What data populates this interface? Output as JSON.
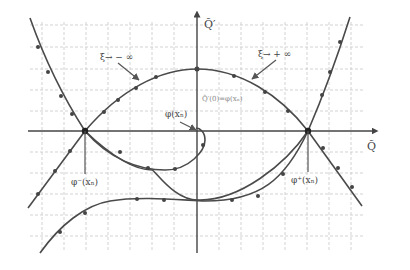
{
  "diagram": {
    "axes": {
      "x_label": "Q̃",
      "y_label": "Q̃′"
    },
    "labels": {
      "xi_minus_inf": "ξ→ − ∞",
      "xi_plus_inf": "ξ→ + ∞",
      "phi_xn": "φ(xₙ)",
      "phi_minus_xn": "φ⁻(xₙ)",
      "phi_plus_xn": "φ⁺(xₙ)",
      "center_annotation": "Q̃′(0)=φ(xₙ)"
    },
    "colors": {
      "curve": "#4a4a4a",
      "axis": "#444444",
      "grid": "#c8c8c8",
      "background": "#ffffff"
    },
    "points": {
      "saddle_left": {
        "x": 85,
        "y": 131
      },
      "saddle_right": {
        "x": 308,
        "y": 131
      },
      "top_of_arch": {
        "x": 197,
        "y": 69
      }
    }
  }
}
